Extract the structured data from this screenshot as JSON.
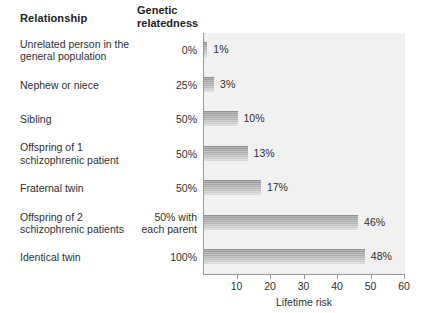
{
  "headers": {
    "relationship": "Relationship",
    "genetic_line1": "Genetic",
    "genetic_line2": "relatedness"
  },
  "rows": [
    {
      "relationship_line1": "Unrelated person in the",
      "relationship_line2": "general population",
      "genetic_line1": "0%",
      "genetic_line2": "",
      "value_label": "1%",
      "value": 1
    },
    {
      "relationship_line1": "Nephew or niece",
      "relationship_line2": "",
      "genetic_line1": "25%",
      "genetic_line2": "",
      "value_label": "3%",
      "value": 3
    },
    {
      "relationship_line1": "Sibling",
      "relationship_line2": "",
      "genetic_line1": "50%",
      "genetic_line2": "",
      "value_label": "10%",
      "value": 10
    },
    {
      "relationship_line1": "Offspring of 1",
      "relationship_line2": "schizophrenic patient",
      "genetic_line1": "50%",
      "genetic_line2": "",
      "value_label": "13%",
      "value": 13
    },
    {
      "relationship_line1": "Fraternal twin",
      "relationship_line2": "",
      "genetic_line1": "50%",
      "genetic_line2": "",
      "value_label": "17%",
      "value": 17
    },
    {
      "relationship_line1": "Offspring of 2",
      "relationship_line2": "schizophrenic patients",
      "genetic_line1": "50% with",
      "genetic_line2": "each parent",
      "value_label": "46%",
      "value": 46
    },
    {
      "relationship_line1": "Identical twin",
      "relationship_line2": "",
      "genetic_line1": "100%",
      "genetic_line2": "",
      "value_label": "48%",
      "value": 48
    }
  ],
  "axis": {
    "title": "Lifetime risk",
    "ticks": [
      "10",
      "20",
      "30",
      "40",
      "50",
      "60"
    ],
    "tick_values": [
      10,
      20,
      30,
      40,
      50,
      60
    ]
  },
  "colors": {
    "plot_background": "#f1f1f1",
    "bar_top": "#8e8e8e",
    "bar_bottom": "#dedede",
    "axis_line": "#9a9a9a",
    "text": "#2f2f2f",
    "page_background": "#ffffff"
  },
  "chart_data": {
    "type": "bar",
    "orientation": "horizontal",
    "title": "",
    "xlabel": "Lifetime risk",
    "ylabel": "",
    "xlim": [
      0,
      60
    ],
    "grid": false,
    "legend": "none",
    "categories": [
      "Unrelated person in the general population",
      "Nephew or niece",
      "Sibling",
      "Offspring of 1 schizophrenic patient",
      "Fraternal twin",
      "Offspring of 2 schizophrenic patients",
      "Identical twin"
    ],
    "values": [
      1,
      3,
      10,
      13,
      17,
      46,
      48
    ],
    "data_labels": [
      "1%",
      "3%",
      "10%",
      "13%",
      "17%",
      "46%",
      "48%"
    ],
    "genetic_relatedness": [
      "0%",
      "25%",
      "50%",
      "50%",
      "50%",
      "50% with each parent",
      "100%"
    ],
    "xticks": [
      10,
      20,
      30,
      40,
      50,
      60
    ],
    "xticklabels": [
      "10",
      "20",
      "30",
      "40",
      "50",
      "60"
    ]
  }
}
